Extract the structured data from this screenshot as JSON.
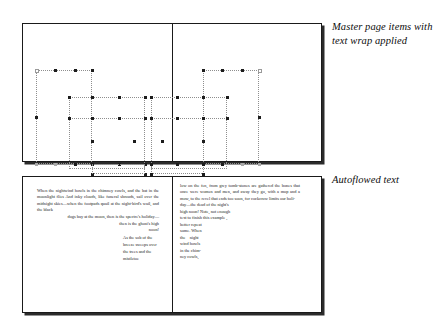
{
  "figure": {
    "captions": {
      "master": "Master page items with text wrap applied",
      "autoflow": "Autoflowed text"
    }
  },
  "spread_master": {
    "name": "master-page-spread",
    "left_page_label": "",
    "right_page_label": ""
  },
  "spread_text": {
    "name": "autoflowed-text-spread",
    "left_column": {
      "block1": "When the nightwind howls in the chimney cowls, and the bat in the moonlight flies And inky clouds, like funeral shrouds, sail over the midnight skies—when the footpads quail at the night-bird's wail, and the black",
      "block2": "dogs bay at the moon, then is the spectre's holiday—",
      "block3": "then is the ghost's high",
      "block4": "noon!",
      "block5": "As the sob of the breeze sweeps over the trees and the mistletoe"
    },
    "right_column": {
      "block1": "low on the fen, from grey tomb-stones are gathered the bones that once were women and men, and away they go, with a mop and a mow, to the revel that ends too soon, for cockcrow limits our holi-",
      "block2": "day—the dead of the night's",
      "block3": "high noon! Note, not enough",
      "block4": "text to finish this example ,",
      "block5": "better repeat",
      "block6": "some. When",
      "block7": "the    night",
      "block8": "wind howls",
      "block9": "in the chim-",
      "block10": "ney cowls,"
    }
  }
}
